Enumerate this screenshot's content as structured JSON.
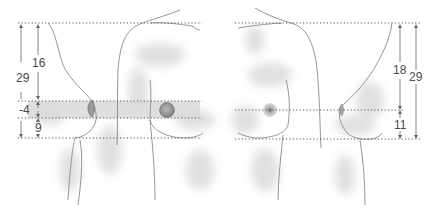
{
  "diagram": {
    "title": "",
    "figures": [
      {
        "name": "left-figure",
        "view": "lateral and frontal torso with highlighted band",
        "measurements": [
          {
            "id": "total",
            "label": "29"
          },
          {
            "id": "upper",
            "label": "16"
          },
          {
            "id": "band",
            "label": "-4"
          },
          {
            "id": "lower",
            "label": "9"
          }
        ]
      },
      {
        "name": "right-figure",
        "view": "frontal and lateral torso",
        "measurements": [
          {
            "id": "upper",
            "label": "18"
          },
          {
            "id": "total",
            "label": "29"
          },
          {
            "id": "lower",
            "label": "11"
          }
        ]
      }
    ],
    "colors": {
      "line": "#8a8a8a",
      "dotted": "#555555",
      "arrow": "#666666",
      "band": "#d9d9d9",
      "shade": "#cfcfcf",
      "text": "#4a4a4a"
    }
  }
}
